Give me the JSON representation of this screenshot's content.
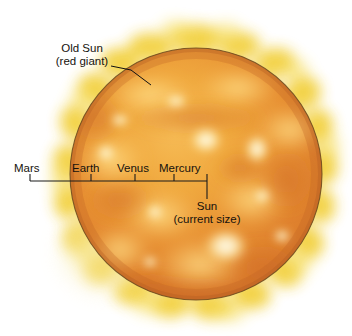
{
  "figure": {
    "title_visible": false,
    "background_color": "#ffffff",
    "width": 352,
    "height": 336
  },
  "sun": {
    "name": "red-giant-sun-disk",
    "center_x": 196,
    "center_y": 174,
    "radius": 126,
    "core_color": "#f2a43a",
    "mid_color": "#e08a2e",
    "edge_color": "#d4762a",
    "outline_color": "#6b4a1e",
    "corona_color": "#f2d233",
    "hotspot_color": "#fffbe8"
  },
  "annotations": {
    "old_sun": {
      "line1": "Old Sun",
      "line2": "(red giant)"
    },
    "current_sun": {
      "line1": "Sun",
      "line2": "(current size)"
    }
  },
  "scale_bar": {
    "axis_y": 181,
    "left_x": 30,
    "right_x": 207,
    "color": "#1a1a1a",
    "ticks": [
      {
        "label": "Mars",
        "x": 30,
        "direction": "down-left-bracket"
      },
      {
        "label": "Earth",
        "x": 91,
        "direction": "up"
      },
      {
        "label": "Venus",
        "x": 135,
        "direction": "up"
      },
      {
        "label": "Mercury",
        "x": 174,
        "direction": "up"
      },
      {
        "label": "Sun",
        "x": 207,
        "direction": "down"
      }
    ]
  },
  "hotspots": [
    {
      "cx": 206,
      "cy": 140,
      "rx": 15,
      "ry": 12
    },
    {
      "cx": 257,
      "cy": 149,
      "rx": 11,
      "ry": 13
    },
    {
      "cx": 226,
      "cy": 246,
      "rx": 20,
      "ry": 16
    },
    {
      "cx": 106,
      "cy": 153,
      "rx": 8,
      "ry": 7
    },
    {
      "cx": 155,
      "cy": 212,
      "rx": 7,
      "ry": 6
    },
    {
      "cx": 176,
      "cy": 101,
      "rx": 10,
      "ry": 6
    },
    {
      "cx": 120,
      "cy": 120,
      "rx": 9,
      "ry": 6
    },
    {
      "cx": 262,
      "cy": 196,
      "rx": 8,
      "ry": 7
    }
  ]
}
